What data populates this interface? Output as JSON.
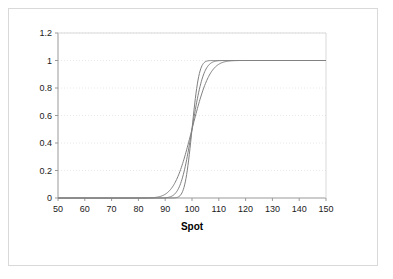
{
  "chart": {
    "title": "",
    "x_axis_title": "Spot",
    "y_axis_title": "",
    "background_color": "#ffffff",
    "frame_color": "#d9d9d9",
    "axis_color": "#999999",
    "gridline_color": "#e8e8e8",
    "curve_color": "#808080"
  },
  "axis": {
    "x_ticks": [
      "50",
      "60",
      "70",
      "80",
      "90",
      "100",
      "110",
      "120",
      "130",
      "140",
      "150"
    ],
    "y_ticks": [
      "0",
      "0.2",
      "0.4",
      "0.6",
      "0.8",
      "1",
      "1.2"
    ]
  },
  "chart_data": {
    "type": "line",
    "title": "",
    "xlabel": "Spot",
    "ylabel": "",
    "xlim": [
      50,
      150
    ],
    "ylim": [
      0,
      1.2
    ],
    "xticks": [
      50,
      60,
      70,
      80,
      90,
      100,
      110,
      120,
      130,
      140,
      150
    ],
    "yticks": [
      0,
      0.2,
      0.4,
      0.6,
      0.8,
      1,
      1.2
    ],
    "grid": "horizontal-dotted",
    "legend": "none",
    "series": [
      {
        "name": "flattest",
        "center": 100,
        "sigma": 5.2,
        "x": [
          50,
          55,
          60,
          65,
          70,
          75,
          78,
          80,
          82,
          84,
          86,
          88,
          90,
          92,
          94,
          96,
          98,
          99,
          100,
          101,
          102,
          104,
          106,
          108,
          110,
          112,
          114,
          116,
          118,
          120,
          125,
          130,
          135,
          140,
          145,
          150
        ],
        "y": [
          0.0,
          0.0,
          0.0,
          0.0,
          0.0,
          0.0,
          0.0,
          0.0,
          0.0,
          0.001,
          0.004,
          0.014,
          0.027,
          0.062,
          0.125,
          0.221,
          0.351,
          0.424,
          0.5,
          0.576,
          0.649,
          0.779,
          0.875,
          0.938,
          0.973,
          0.986,
          0.996,
          0.999,
          1.0,
          1.0,
          1.0,
          1.0,
          1.0,
          1.0,
          1.0,
          1.0
        ]
      },
      {
        "name": "middle",
        "center": 100,
        "sigma": 3.4,
        "x": [
          50,
          55,
          60,
          65,
          70,
          75,
          78,
          80,
          82,
          84,
          86,
          88,
          90,
          92,
          94,
          96,
          98,
          99,
          100,
          101,
          102,
          104,
          106,
          108,
          110,
          112,
          114,
          116,
          118,
          120,
          125,
          130,
          135,
          140,
          145,
          150
        ],
        "y": [
          0.0,
          0.0,
          0.0,
          0.0,
          0.0,
          0.0,
          0.0,
          0.0,
          0.0,
          0.0,
          0.0,
          0.0,
          0.002,
          0.009,
          0.04,
          0.119,
          0.277,
          0.385,
          0.5,
          0.615,
          0.723,
          0.881,
          0.96,
          0.991,
          0.998,
          1.0,
          1.0,
          1.0,
          1.0,
          1.0,
          1.0,
          1.0,
          1.0,
          1.0,
          1.0,
          1.0
        ]
      },
      {
        "name": "steepest",
        "center": 100,
        "sigma": 2.1,
        "x": [
          50,
          55,
          60,
          65,
          70,
          75,
          78,
          80,
          82,
          84,
          86,
          88,
          90,
          92,
          94,
          96,
          98,
          99,
          100,
          101,
          102,
          104,
          106,
          108,
          110,
          112,
          114,
          116,
          118,
          120,
          125,
          130,
          135,
          140,
          145,
          150
        ],
        "y": [
          0.0,
          0.0,
          0.0,
          0.0,
          0.0,
          0.0,
          0.0,
          0.0,
          0.0,
          0.0,
          0.0,
          0.0,
          0.0,
          0.0,
          0.002,
          0.028,
          0.17,
          0.317,
          0.5,
          0.683,
          0.83,
          0.972,
          0.998,
          1.0,
          1.0,
          1.0,
          1.0,
          1.0,
          1.0,
          1.0,
          1.0,
          1.0,
          1.0,
          1.0,
          1.0,
          1.0
        ]
      }
    ]
  }
}
